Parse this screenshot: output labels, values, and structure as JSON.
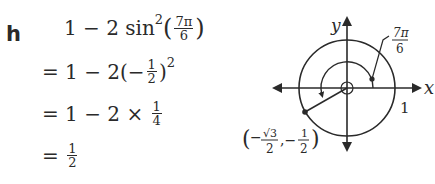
{
  "problem_label": "h",
  "steps": [
    {
      "id": "step-1",
      "prefix": "1 − 2 sin",
      "exponent": "2",
      "frac": {
        "num": "7π",
        "den": "6"
      }
    },
    {
      "id": "step-2",
      "prefix": "= 1 − 2(−",
      "frac": {
        "num": "1",
        "den": "2"
      },
      "suffix": ")",
      "exponent": "2"
    },
    {
      "id": "step-3",
      "prefix": "= 1 − 2 × ",
      "frac": {
        "num": "1",
        "den": "4"
      }
    },
    {
      "id": "step-4",
      "prefix": "= ",
      "frac": {
        "num": "1",
        "den": "2"
      }
    }
  ],
  "diagram": {
    "x_axis_label": "x",
    "y_axis_label": "y",
    "radius_label": "1",
    "angle_label": {
      "num": "7π",
      "den": "6"
    },
    "point_label": {
      "x_num": "√3",
      "x_den": "2",
      "y_num": "1",
      "y_den": "2"
    },
    "point_label_prefix": "(−",
    "point_label_mid": ", −",
    "point_label_suffix": ")",
    "line_color": "#2a2a2a"
  }
}
